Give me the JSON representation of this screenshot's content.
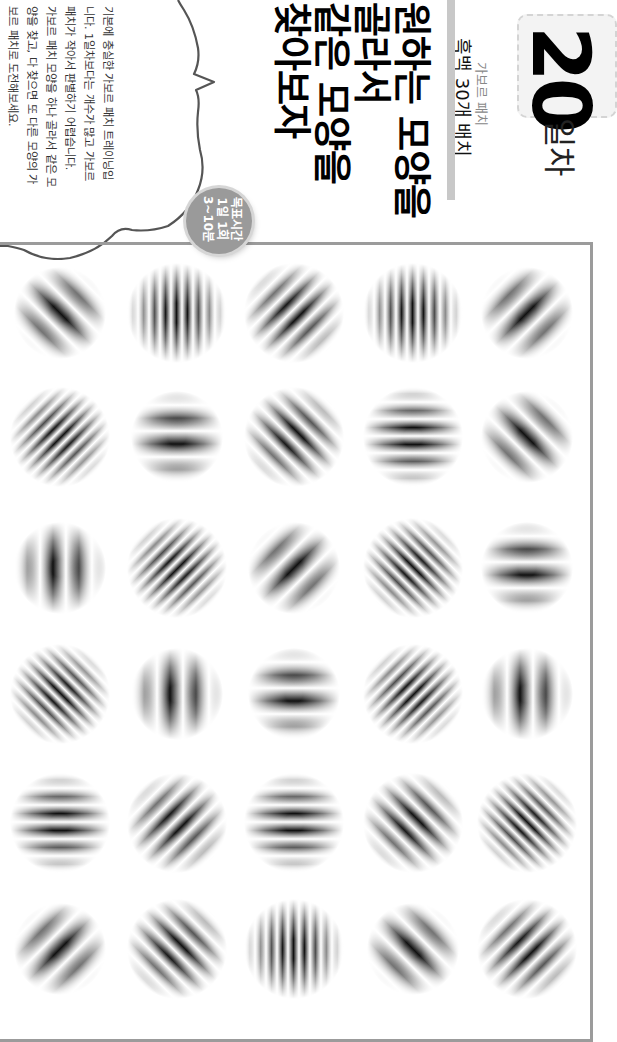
{
  "header": {
    "day_number": "20",
    "day_suffix": "일차",
    "category": "가보르 패치",
    "subtitle": "흑백 30개 배치"
  },
  "headline": {
    "lines": [
      "원하는 모양을",
      "골라서",
      "같은 모양을",
      "찾아보자"
    ]
  },
  "description": {
    "lines": [
      "기본에 충실한 가보르 패치 트레이닝입",
      "니다. 1일차보다는 개수가 많고 가보르",
      "패치가 작아서 판별하기 어렵습니다.",
      "가보르 패치 모양을 하나 골라서 같은 모",
      "양을 찾고, 다 찾으면 또 다른 모양의 가",
      "보르 패치로 도전해보세요."
    ]
  },
  "goal_badge": {
    "lines": [
      "목표시간",
      "1일 1회",
      "3~10분"
    ]
  },
  "colors": {
    "frame": "#9b9b9b",
    "badge": "#9a9a9a",
    "gray_bar": "#c8c8c8",
    "day_box_bg": "#f3f3f3"
  },
  "grid": {
    "columns_x": [
      60,
      177,
      294,
      413,
      527
    ],
    "rows_y": [
      313,
      437,
      568,
      694,
      823,
      949
    ],
    "patch_legend": "orientation = stripe direction as seen on screen (vertical | horizontal | diag-down '\\' | diag-up '/'); freq = low | mid | high",
    "patches": [
      [
        {
          "o": "diag-down",
          "f": "low"
        },
        {
          "o": "vertical",
          "f": "high"
        },
        {
          "o": "diag-up",
          "f": "mid"
        },
        {
          "o": "vertical",
          "f": "high"
        },
        {
          "o": "diag-up",
          "f": "low"
        }
      ],
      [
        {
          "o": "diag-up",
          "f": "high"
        },
        {
          "o": "horizontal",
          "f": "low"
        },
        {
          "o": "diag-down",
          "f": "mid"
        },
        {
          "o": "horizontal",
          "f": "mid"
        },
        {
          "o": "diag-down",
          "f": "low"
        }
      ],
      [
        {
          "o": "vertical",
          "f": "low"
        },
        {
          "o": "diag-up",
          "f": "high"
        },
        {
          "o": "diag-up",
          "f": "low"
        },
        {
          "o": "diag-down",
          "f": "high"
        },
        {
          "o": "horizontal",
          "f": "low"
        }
      ],
      [
        {
          "o": "diag-down",
          "f": "high"
        },
        {
          "o": "vertical",
          "f": "low"
        },
        {
          "o": "horizontal",
          "f": "low"
        },
        {
          "o": "diag-up",
          "f": "high"
        },
        {
          "o": "vertical",
          "f": "low"
        }
      ],
      [
        {
          "o": "horizontal",
          "f": "mid"
        },
        {
          "o": "diag-up",
          "f": "mid"
        },
        {
          "o": "horizontal",
          "f": "mid"
        },
        {
          "o": "diag-down",
          "f": "mid"
        },
        {
          "o": "diag-down",
          "f": "high"
        }
      ],
      [
        {
          "o": "diag-up",
          "f": "low"
        },
        {
          "o": "diag-down",
          "f": "mid"
        },
        {
          "o": "vertical",
          "f": "high"
        },
        {
          "o": "diag-down",
          "f": "low"
        },
        {
          "o": "diag-up",
          "f": "mid"
        }
      ]
    ]
  }
}
